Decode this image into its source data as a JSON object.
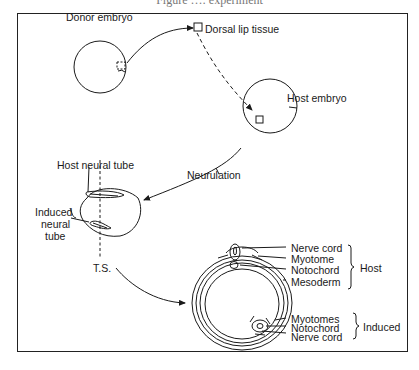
{
  "caption_clipped": "Figure …: experiment",
  "labels": {
    "donor_embryo": "Donor embryo",
    "dorsal_lip_tissue": "Dorsal lip tissue",
    "host_embryo": "Host embryo",
    "neurulation": "Neurulation",
    "host_neural_tube": "Host neural tube",
    "induced_neural_tube_1": "Induced",
    "induced_neural_tube_2": "neural",
    "induced_neural_tube_3": "tube",
    "ts": "T.S."
  },
  "host_structures": {
    "items": [
      "Nerve cord",
      "Myotome",
      "Notochord",
      "Mesoderm"
    ],
    "group_label": "Host"
  },
  "induced_structures": {
    "items": [
      "Myotomes",
      "Notochord",
      "Nerve cord"
    ],
    "group_label": "Induced"
  }
}
